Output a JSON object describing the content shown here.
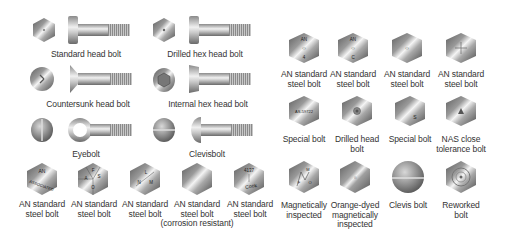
{
  "left_section": {
    "bolt_types": [
      {
        "label": "Standard head bolt",
        "icon": "standard-hex-head-bolt-icon"
      },
      {
        "label": "Drilled hex head bolt",
        "icon": "drilled-hex-head-bolt-icon"
      },
      {
        "label": "Countersunk head bolt",
        "icon": "countersunk-head-bolt-icon"
      },
      {
        "label": "Internal hex head bolt",
        "icon": "internal-hex-head-bolt-icon"
      },
      {
        "label": "Eyebolt",
        "icon": "eyebolt-icon"
      },
      {
        "label": "Clevisbolt",
        "icon": "clevis-bolt-icon"
      }
    ],
    "head_markings": [
      {
        "label_line1": "AN standard",
        "label_line2": "steel bolt",
        "label_line3": "",
        "marks": [
          "AN",
          "ASSOCIATED"
        ]
      },
      {
        "label_line1": "AN standard",
        "label_line2": "steel bolt",
        "label_line3": "",
        "marks": [
          "A",
          "F",
          "S",
          "O"
        ]
      },
      {
        "label_line1": "AN standard",
        "label_line2": "steel bolt",
        "label_line3": "",
        "marks": [
          "L",
          "N",
          "M"
        ]
      },
      {
        "label_line1": "AN standard",
        "label_line2": "steel bolt",
        "label_line3": "(corrosion resistant)",
        "marks": []
      },
      {
        "label_line1": "AN standard",
        "label_line2": "steel bolt",
        "label_line3": "",
        "marks": [
          "4137",
          "Cook"
        ]
      }
    ]
  },
  "right_section": {
    "row1": [
      {
        "label_line1": "AN standard",
        "label_line2": "steel bolt",
        "marks": [
          "AN",
          "4"
        ]
      },
      {
        "label_line1": "AN standard",
        "label_line2": "steel bolt",
        "marks": [
          "AN",
          "C"
        ]
      },
      {
        "label_line1": "AN standard",
        "label_line2": "steel bolt",
        "marks": []
      },
      {
        "label_line1": "AN standard",
        "label_line2": "steel bolt",
        "marks": [
          "+"
        ]
      }
    ],
    "row2": [
      {
        "label_line1": "Special bolt",
        "label_line2": "",
        "marks": [
          "AS-59722"
        ]
      },
      {
        "label_line1": "Drilled head",
        "label_line2": "bolt",
        "marks": []
      },
      {
        "label_line1": "Special bolt",
        "label_line2": "",
        "marks": [
          "S"
        ]
      },
      {
        "label_line1": "NAS close",
        "label_line2": "tolerance bolt",
        "marks": [
          "A"
        ]
      }
    ],
    "row3": [
      {
        "label_line1": "Magnetically",
        "label_line2": "inspected",
        "label_line3": "",
        "marks": [
          "M",
          "F",
          "O"
        ]
      },
      {
        "label_line1": "Orange-dyed",
        "label_line2": "magnetically",
        "label_line3": "inspected",
        "marks": []
      },
      {
        "label_line1": "Clevis bolt",
        "label_line2": "",
        "label_line3": "",
        "marks": []
      },
      {
        "label_line1": "Reworked",
        "label_line2": "bolt",
        "label_line3": "",
        "marks": []
      }
    ]
  },
  "colors": {
    "background": "#ffffff",
    "text": "#333333",
    "metal_light": "#f2f2f2",
    "metal_dark": "#6e6e6e"
  }
}
